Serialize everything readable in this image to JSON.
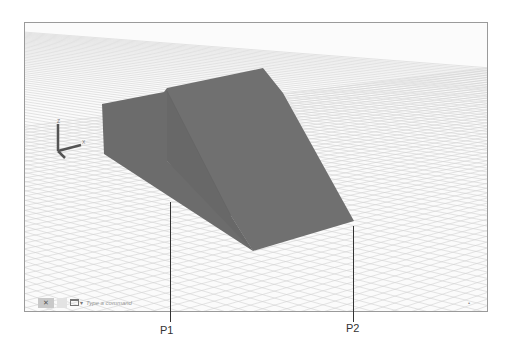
{
  "viewport": {
    "background": "#fbfbfb",
    "grid_color": "#d0d0d0",
    "solid_color": "#6e6e6e",
    "solid_dark": "#646464",
    "solid_light": "#767676"
  },
  "ucs_icon": {
    "name": "ucs-axis-icon",
    "axes": [
      "Z",
      "X"
    ]
  },
  "command_line": {
    "close_label": "✕",
    "placeholder": "Type a command",
    "caret": "▾"
  },
  "status": {
    "corner_glyph": "•"
  },
  "callouts": [
    {
      "label": "P1",
      "x": 170,
      "y_top": 202,
      "y_bottom": 322
    },
    {
      "label": "P2",
      "x": 353,
      "y_top": 226,
      "y_bottom": 322
    }
  ]
}
